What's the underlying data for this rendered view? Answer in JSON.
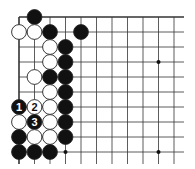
{
  "diagram": {
    "type": "go-board-corner",
    "grid": {
      "origin_x": 19,
      "origin_y": 17,
      "col_spacing": 15.5,
      "row_spacing": 15,
      "cols": 11,
      "rows": 10,
      "right_extent": 184,
      "bottom_extent": 164,
      "top_edge": true,
      "left_edge": true
    },
    "colors": {
      "line": "#333333",
      "black": "#111111",
      "white": "#ffffff",
      "stone_outline": "#222222"
    },
    "star_points": [
      {
        "col": 9,
        "row": 3
      },
      {
        "col": 9,
        "row": 9
      },
      {
        "col": 3,
        "row": 9
      }
    ],
    "stones": [
      {
        "col": 1,
        "row": 0,
        "color": "black"
      },
      {
        "col": 0,
        "row": 1,
        "color": "white"
      },
      {
        "col": 1,
        "row": 1,
        "color": "white"
      },
      {
        "col": 2,
        "row": 1,
        "color": "black"
      },
      {
        "col": 4,
        "row": 1,
        "color": "black"
      },
      {
        "col": 2,
        "row": 2,
        "color": "white"
      },
      {
        "col": 3,
        "row": 2,
        "color": "black"
      },
      {
        "col": 2,
        "row": 3,
        "color": "white"
      },
      {
        "col": 3,
        "row": 3,
        "color": "black"
      },
      {
        "col": 1,
        "row": 4,
        "color": "white"
      },
      {
        "col": 2,
        "row": 4,
        "color": "black"
      },
      {
        "col": 3,
        "row": 4,
        "color": "black"
      },
      {
        "col": 2,
        "row": 5,
        "color": "white"
      },
      {
        "col": 3,
        "row": 5,
        "color": "black"
      },
      {
        "col": 0,
        "row": 6,
        "color": "black",
        "label": "1"
      },
      {
        "col": 1,
        "row": 6,
        "color": "white",
        "label": "2"
      },
      {
        "col": 2,
        "row": 6,
        "color": "white"
      },
      {
        "col": 3,
        "row": 6,
        "color": "black"
      },
      {
        "col": 0,
        "row": 7,
        "color": "white"
      },
      {
        "col": 1,
        "row": 7,
        "color": "black",
        "label": "3"
      },
      {
        "col": 2,
        "row": 7,
        "color": "white"
      },
      {
        "col": 3,
        "row": 7,
        "color": "black"
      },
      {
        "col": 0,
        "row": 8,
        "color": "black"
      },
      {
        "col": 1,
        "row": 8,
        "color": "white"
      },
      {
        "col": 2,
        "row": 8,
        "color": "white"
      },
      {
        "col": 3,
        "row": 8,
        "color": "black"
      },
      {
        "col": 0,
        "row": 9,
        "color": "black"
      },
      {
        "col": 1,
        "row": 9,
        "color": "black"
      },
      {
        "col": 2,
        "row": 9,
        "color": "black"
      }
    ]
  }
}
